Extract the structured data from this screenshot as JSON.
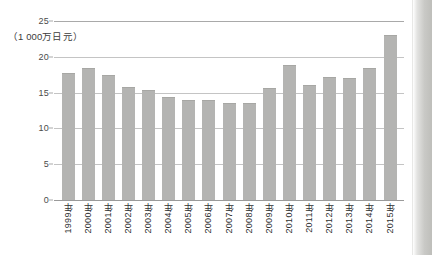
{
  "chart_data": {
    "type": "bar",
    "title": "",
    "subtitle": "",
    "xlabel": "",
    "ylabel": "（1 000万日元）",
    "unit_label": "（1 000万日元）",
    "ylim": [
      0,
      25
    ],
    "yticks": [
      0,
      5,
      10,
      15,
      20,
      25
    ],
    "ytick_labels": [
      "0",
      "5",
      "10",
      "15",
      "20",
      "25"
    ],
    "grid": true,
    "grid_axis": "y",
    "legend": null,
    "legend_position": "none",
    "bar_color": "#b4b4b2",
    "categories": [
      "1999年",
      "2000年",
      "2001年",
      "2002年",
      "2003年",
      "2004年",
      "2005年",
      "2006年",
      "2007年",
      "2008年",
      "2009年",
      "2010年",
      "2011年",
      "2012年",
      "2013年",
      "2014年",
      "2015年"
    ],
    "values": [
      17.7,
      18.4,
      17.4,
      15.8,
      15.4,
      14.4,
      13.9,
      14.0,
      13.6,
      13.5,
      15.6,
      18.8,
      16.1,
      17.2,
      17.0,
      18.4,
      23.0
    ]
  }
}
